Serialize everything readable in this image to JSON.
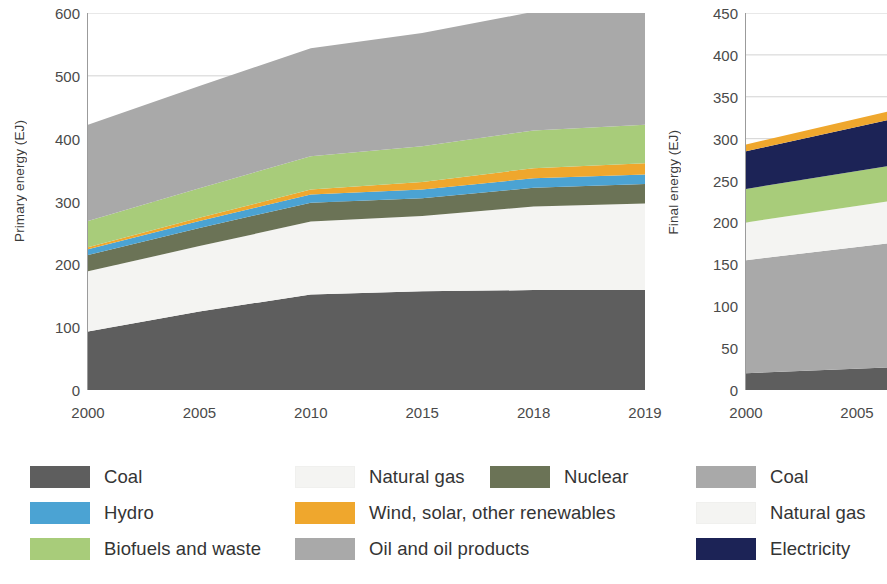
{
  "colors": {
    "coal": "#5e5e5e",
    "oil": "#a9a9a9",
    "natural_gas": "#f4f4f2",
    "nuclear": "#6b7356",
    "hydro": "#4ba3d3",
    "biofuels": "#a8cc7a",
    "wind_solar": "#efa72d",
    "electricity": "#1c2356",
    "gridline": "#d2d2d2",
    "axis": "#9b9b9b",
    "text": "#3b3b3b"
  },
  "legend_left": {
    "items": [
      {
        "label": "Coal",
        "color_key": "coal",
        "col": 0,
        "row": 0
      },
      {
        "label": "Natural gas",
        "color_key": "natural_gas",
        "col": 1,
        "row": 0
      },
      {
        "label": "Nuclear",
        "color_key": "nuclear",
        "col": 2,
        "row": 0
      },
      {
        "label": "Hydro",
        "color_key": "hydro",
        "col": 0,
        "row": 1
      },
      {
        "label": "Wind, solar, other renewables",
        "color_key": "wind_solar",
        "col": 1,
        "row": 1
      },
      {
        "label": "Biofuels and waste",
        "color_key": "biofuels",
        "col": 0,
        "row": 2
      },
      {
        "label": "Oil and oil products",
        "color_key": "oil",
        "col": 1,
        "row": 2
      }
    ]
  },
  "legend_right": {
    "items": [
      {
        "label": "Coal",
        "color_key": "oil",
        "row": 0
      },
      {
        "label": "Natural gas",
        "color_key": "natural_gas",
        "row": 1
      },
      {
        "label": "Electricity",
        "color_key": "electricity",
        "row": 2
      }
    ]
  },
  "chart_data": [
    {
      "id": "primary-energy",
      "type": "area",
      "stacked": true,
      "title": "",
      "xlabel": "",
      "ylabel": "Primary energy (EJ)",
      "categories": [
        "2000",
        "2005",
        "2010",
        "2015",
        "2018",
        "2019"
      ],
      "xticklabels": [
        "2000",
        "2005",
        "2010",
        "2015",
        "2018",
        "2019"
      ],
      "yticks": [
        0,
        100,
        200,
        300,
        400,
        500,
        600
      ],
      "ylim": [
        0,
        600
      ],
      "grid": "horizontal",
      "legend_position": "below",
      "series": [
        {
          "name": "Coal",
          "color_key": "coal",
          "values": [
            93,
            125,
            152,
            157,
            159,
            159
          ]
        },
        {
          "name": "Natural gas",
          "color_key": "natural_gas",
          "values": [
            96,
            104,
            116,
            120,
            133,
            138
          ]
        },
        {
          "name": "Nuclear",
          "color_key": "nuclear",
          "values": [
            26,
            29,
            30,
            28,
            30,
            31
          ]
        },
        {
          "name": "Hydro",
          "color_key": "hydro",
          "values": [
            9,
            11,
            13,
            14,
            15,
            15
          ]
        },
        {
          "name": "Wind, solar, other renewables",
          "color_key": "wind_solar",
          "values": [
            3,
            5,
            8,
            12,
            16,
            18
          ]
        },
        {
          "name": "Biofuels and waste",
          "color_key": "biofuels",
          "values": [
            42,
            47,
            53,
            57,
            60,
            61
          ]
        },
        {
          "name": "Oil and oil products",
          "color_key": "oil",
          "values": [
            153,
            163,
            172,
            180,
            189,
            190
          ]
        }
      ],
      "totals": [
        422,
        484,
        544,
        568,
        602,
        612
      ]
    },
    {
      "id": "final-energy",
      "type": "area",
      "stacked": true,
      "title": "",
      "xlabel": "",
      "ylabel": "Final energy (EJ)",
      "categories": [
        "2000",
        "2005"
      ],
      "xticklabels": [
        "2000",
        "2005"
      ],
      "yticks": [
        0,
        50,
        100,
        150,
        200,
        250,
        300,
        350,
        400,
        450
      ],
      "ylim": [
        0,
        450
      ],
      "grid": "horizontal",
      "legend_position": "below",
      "note": "panel cropped at right edge of image",
      "series": [
        {
          "name": "Coal",
          "color_key": "coal",
          "values": [
            20,
            27
          ]
        },
        {
          "name": "Oil and oil products",
          "color_key": "oil",
          "values": [
            135,
            148
          ]
        },
        {
          "name": "Natural gas",
          "color_key": "natural_gas",
          "values": [
            45,
            50
          ]
        },
        {
          "name": "Biofuels and waste",
          "color_key": "biofuels",
          "values": [
            40,
            42
          ]
        },
        {
          "name": "Electricity",
          "color_key": "electricity",
          "values": [
            45,
            55
          ]
        },
        {
          "name": "Wind, solar, other renewables",
          "color_key": "wind_solar",
          "values": [
            8,
            10
          ]
        }
      ],
      "totals": [
        293,
        332
      ]
    }
  ]
}
